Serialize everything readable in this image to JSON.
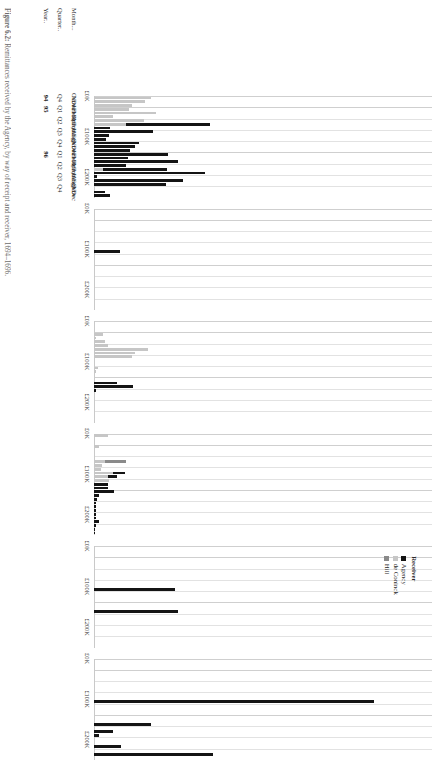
{
  "figure": {
    "caption_number": "Figure 6.2:",
    "caption_text": "Remittances received by the Agency, by way of receipt and receiver, 1694–1696."
  },
  "strip": {
    "supertitle": "Received By Way Of",
    "panels": [
      "bills remitted",
      "bullion",
      "Meulenaer",
      "other",
      "Schuylenburg",
      "States General"
    ]
  },
  "legend": {
    "title": "Receiver",
    "items": [
      {
        "label": "Agency",
        "color": "#141414"
      },
      {
        "label": "de Coninck",
        "color": "#c6c6c6"
      },
      {
        "label": "Hill",
        "color": "#8a8a8a"
      }
    ]
  },
  "axes": {
    "value_ticks": [
      "£0K",
      "£100K",
      "£200K"
    ],
    "value_max": 250000,
    "row_headers": {
      "year": "Year..",
      "quarter": "Quarter..",
      "month": "Month..."
    }
  },
  "chart_data": {
    "type": "bar",
    "title": "Remittances received by the Agency, by way of receipt and receiver",
    "xlabel": "Year / Quarter / Month",
    "ylabel": "£",
    "ylim": [
      0,
      250000
    ],
    "grid": false,
    "legend_position": "inside-top-left",
    "orientation": "vertical-bars-in-rotated-plate",
    "facet_label": "Received By Way Of",
    "facets": [
      "bills remitted",
      "bullion",
      "Meulenaer",
      "other",
      "Schuylenburg",
      "States General"
    ],
    "series": [
      {
        "name": "Agency",
        "color": "#141414"
      },
      {
        "name": "de Coninck",
        "color": "#c6c6c6"
      },
      {
        "name": "Hill",
        "color": "#8a8a8a"
      }
    ],
    "categories": [
      {
        "year": "94",
        "quarter": "Q4",
        "month": "Oct"
      },
      {
        "year": "",
        "quarter": "",
        "month": "Nov"
      },
      {
        "year": "",
        "quarter": "",
        "month": "Dec"
      },
      {
        "year": "95",
        "quarter": "Q1",
        "month": "Jan"
      },
      {
        "year": "",
        "quarter": "",
        "month": "Feb"
      },
      {
        "year": "",
        "quarter": "",
        "month": "Mar"
      },
      {
        "year": "",
        "quarter": "Q2",
        "month": "Apr"
      },
      {
        "year": "",
        "quarter": "",
        "month": "May"
      },
      {
        "year": "",
        "quarter": "",
        "month": "Jun"
      },
      {
        "year": "",
        "quarter": "Q3",
        "month": "Jul"
      },
      {
        "year": "",
        "quarter": "",
        "month": "Aug"
      },
      {
        "year": "",
        "quarter": "",
        "month": "Sep"
      },
      {
        "year": "",
        "quarter": "Q4",
        "month": "Oct"
      },
      {
        "year": "",
        "quarter": "",
        "month": "Nov"
      },
      {
        "year": "",
        "quarter": "",
        "month": "Dec"
      },
      {
        "year": "96",
        "quarter": "Q1",
        "month": "Jan"
      },
      {
        "year": "",
        "quarter": "",
        "month": "Feb"
      },
      {
        "year": "",
        "quarter": "",
        "month": "Mar"
      },
      {
        "year": "",
        "quarter": "Q2",
        "month": "Apr"
      },
      {
        "year": "",
        "quarter": "",
        "month": "May"
      },
      {
        "year": "",
        "quarter": "",
        "month": "Jun"
      },
      {
        "year": "",
        "quarter": "Q3",
        "month": "Jul"
      },
      {
        "year": "",
        "quarter": "",
        "month": "Aug"
      },
      {
        "year": "",
        "quarter": "",
        "month": "Sep"
      },
      {
        "year": "",
        "quarter": "Q4",
        "month": "Oct"
      },
      {
        "year": "",
        "quarter": "",
        "month": "Nov"
      },
      {
        "year": "",
        "quarter": "",
        "month": "Dec"
      }
    ],
    "panel_values": {
      "bills remitted": {
        "Agency": [
          0,
          0,
          0,
          0,
          0,
          0,
          0,
          62000,
          12000,
          44000,
          11000,
          9000,
          33000,
          30000,
          27000,
          55000,
          25000,
          62000,
          24000,
          47000,
          82000,
          2000,
          66000,
          53000,
          0,
          8000,
          12000
        ],
        "de Coninck": [
          42000,
          38000,
          28000,
          26000,
          46000,
          14000,
          37000,
          24000,
          0,
          0,
          0,
          0,
          0,
          0,
          0,
          0,
          0,
          0,
          0,
          7000,
          0,
          0,
          0,
          0,
          0,
          0,
          0
        ],
        "Hill": [
          0,
          0,
          0,
          0,
          0,
          0,
          0,
          0,
          0,
          0,
          0,
          0,
          0,
          0,
          0,
          0,
          0,
          0,
          0,
          0,
          0,
          0,
          0,
          0,
          0,
          0,
          0
        ]
      },
      "bullion": {
        "Agency": [
          0,
          0,
          0,
          0,
          0,
          0,
          0,
          0,
          0,
          0,
          0,
          19000,
          0,
          0,
          0,
          0,
          0,
          0,
          0,
          0,
          0,
          0,
          0,
          0,
          0,
          0,
          0
        ],
        "de Coninck": [
          0,
          0,
          0,
          0,
          0,
          0,
          0,
          0,
          0,
          0,
          0,
          0,
          0,
          0,
          0,
          0,
          0,
          0,
          0,
          0,
          0,
          0,
          0,
          0,
          0,
          0,
          0
        ],
        "Hill": [
          0,
          0,
          0,
          0,
          0,
          0,
          0,
          0,
          0,
          0,
          0,
          0,
          0,
          0,
          0,
          0,
          0,
          0,
          0,
          0,
          0,
          0,
          0,
          0,
          0,
          0,
          0
        ]
      },
      "Meulenaer": {
        "Agency": [
          0,
          0,
          0,
          0,
          0,
          0,
          0,
          0,
          0,
          0,
          0,
          0,
          0,
          0,
          0,
          0,
          17000,
          29000,
          1500,
          0,
          0,
          0,
          0,
          0,
          0,
          0,
          0
        ],
        "de Coninck": [
          0,
          0,
          0,
          7000,
          1500,
          8000,
          10000,
          40000,
          30000,
          28000,
          0,
          0,
          3000,
          1500,
          0,
          0,
          0,
          0,
          0,
          0,
          0,
          0,
          0,
          0,
          0,
          0,
          0
        ],
        "Hill": [
          0,
          0,
          0,
          0,
          0,
          0,
          0,
          0,
          0,
          0,
          0,
          0,
          0,
          0,
          0,
          0,
          0,
          0,
          0,
          0,
          0,
          0,
          0,
          0,
          0,
          0,
          0
        ]
      },
      "other": {
        "Agency": [
          0,
          0,
          0,
          0,
          0,
          0,
          0,
          0,
          0,
          0,
          9000,
          7000,
          0,
          10000,
          10000,
          15000,
          4000,
          2500,
          1500,
          1500,
          1500,
          1500,
          1500,
          3500,
          1500,
          1000,
          500
        ],
        "de Coninck": [
          10000,
          0,
          0,
          4000,
          0,
          0,
          0,
          8000,
          6000,
          5000,
          14000,
          10000,
          11000,
          0,
          0,
          0,
          0,
          0,
          0,
          0,
          0,
          0,
          0,
          0,
          0,
          0,
          0
        ],
        "Hill": [
          0,
          0,
          0,
          0,
          0,
          0,
          0,
          16000,
          0,
          0,
          0,
          0,
          0,
          0,
          0,
          0,
          0,
          0,
          0,
          0,
          0,
          0,
          0,
          0,
          0,
          0,
          0
        ]
      },
      "Schuylenburg": {
        "Agency": [
          0,
          0,
          0,
          0,
          0,
          0,
          0,
          0,
          0,
          0,
          0,
          60000,
          0,
          0,
          0,
          0,
          0,
          62000,
          0,
          0,
          0,
          0,
          0,
          0,
          0,
          0,
          0
        ],
        "de Coninck": [
          0,
          0,
          0,
          0,
          0,
          0,
          0,
          0,
          0,
          0,
          0,
          0,
          0,
          0,
          0,
          0,
          0,
          0,
          0,
          0,
          0,
          0,
          0,
          0,
          0,
          0,
          0
        ],
        "Hill": [
          0,
          0,
          0,
          0,
          0,
          0,
          0,
          0,
          0,
          0,
          0,
          0,
          0,
          0,
          0,
          0,
          0,
          0,
          0,
          0,
          0,
          0,
          0,
          0,
          0,
          0,
          0
        ]
      },
      "States General": {
        "Agency": [
          0,
          0,
          0,
          0,
          0,
          0,
          0,
          0,
          0,
          0,
          0,
          207000,
          0,
          0,
          0,
          0,
          0,
          42000,
          0,
          14000,
          4000,
          0,
          0,
          20000,
          0,
          88000,
          0
        ],
        "de Coninck": [
          0,
          0,
          0,
          0,
          0,
          0,
          0,
          0,
          0,
          0,
          0,
          0,
          0,
          0,
          0,
          0,
          0,
          0,
          0,
          0,
          0,
          0,
          0,
          0,
          0,
          0,
          0
        ],
        "Hill": [
          0,
          0,
          0,
          0,
          0,
          0,
          0,
          0,
          0,
          0,
          0,
          0,
          0,
          0,
          0,
          0,
          0,
          0,
          0,
          0,
          0,
          0,
          0,
          0,
          0,
          0,
          0
        ]
      }
    }
  }
}
